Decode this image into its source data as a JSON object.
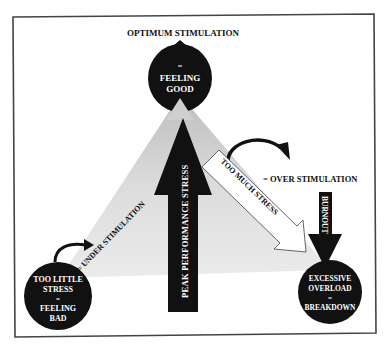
{
  "diagram": {
    "top_label": "OPTIMUM STIMULATION",
    "nodes": {
      "top": {
        "line1": "=",
        "line2": "FEELING",
        "line3": "GOOD"
      },
      "bottom_left": {
        "line1": "TOO LITTLE",
        "line2": "STRESS",
        "line3": "=",
        "line4": "FEELING",
        "line5": "BAD"
      },
      "bottom_right": {
        "line1": "EXCESSIVE",
        "line2": "OVERLOAD",
        "line3": "=",
        "line4": "BREAKDOWN"
      }
    },
    "arrows": {
      "center": "PEAK PERFORMANCE STRESS",
      "diagonal_right": "TOO MUCH STRESS",
      "burnout": "BURNOUT"
    },
    "labels": {
      "under": "= UNDER STIMULATION",
      "over": "= OVER STIMULATION"
    },
    "colors": {
      "ink": "#111111",
      "triangle_fill": "#d9d9d9",
      "frame": "#444444",
      "background": "#ffffff"
    }
  }
}
